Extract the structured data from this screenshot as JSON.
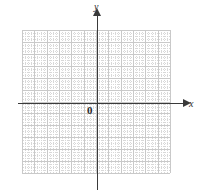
{
  "figure": {
    "type": "coordinate-grid",
    "width": 201,
    "height": 194,
    "background_color": "#ffffff"
  },
  "labels": {
    "x_axis": "x",
    "y_axis": "y",
    "origin": "0"
  },
  "chart_data": {
    "type": "scatter",
    "title": "",
    "subtitle": "",
    "xlabel": "x",
    "ylabel": "y",
    "origin_label": "0",
    "series": [
      {
        "name": "",
        "x": [],
        "y": []
      }
    ],
    "x": [],
    "values": [],
    "categories": [],
    "xlim": [
      -6,
      6
    ],
    "ylim": [
      -6,
      6
    ],
    "xticks": [
      -6,
      -5,
      -4,
      -3,
      -2,
      -1,
      0,
      1,
      2,
      3,
      4,
      5,
      6
    ],
    "yticks": [
      -6,
      -5,
      -4,
      -3,
      -2,
      -1,
      0,
      1,
      2,
      3,
      4,
      5,
      6
    ],
    "xtick_labels": [],
    "ytick_labels": [],
    "grid": true,
    "grid_major_columns": 12,
    "grid_major_rows": 12,
    "grid_minor_per_major": 4,
    "legend": [],
    "legend_position": "none",
    "annotations": []
  },
  "style": {
    "axis_color": "#3a3a3a",
    "major_grid_color": "#c9c9c9",
    "minor_grid_color": "#d8d8d8",
    "label_color": "#2e2e2e"
  },
  "geometry": {
    "grid_left": 22,
    "grid_top": 30,
    "grid_width": 148,
    "grid_height": 143,
    "major_step_x": 12.333,
    "major_step_y": 11.917,
    "minor_step_x": 3.083,
    "minor_step_y": 2.979,
    "x_axis_y": 103,
    "y_axis_x": 97
  }
}
